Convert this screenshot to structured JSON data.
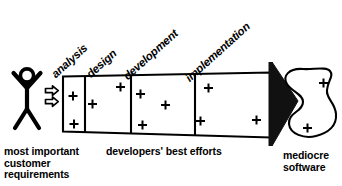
{
  "diagram": {
    "phases": [
      {
        "label": "analysis",
        "x": 57,
        "y": 68,
        "rotate": -42
      },
      {
        "label": "design",
        "x": 90,
        "y": 68,
        "rotate": -42
      },
      {
        "label": "development",
        "x": 128,
        "y": 70,
        "rotate": -42
      },
      {
        "label": "implementation",
        "x": 190,
        "y": 72,
        "rotate": -42
      }
    ],
    "captions": {
      "left": "most important\ncustomer\nrequirements",
      "middle": "developers' best efforts",
      "right": "mediocre\nsoftware"
    },
    "actor": {
      "name": "stick-figure-customer"
    },
    "feed_arrows": 2,
    "plus_marks_in_funnel": 9,
    "plus_marks_in_blob": 2,
    "output_shape": "amoeba-blob",
    "colors": {
      "ink": "#000000",
      "paper": "#ffffff"
    }
  }
}
